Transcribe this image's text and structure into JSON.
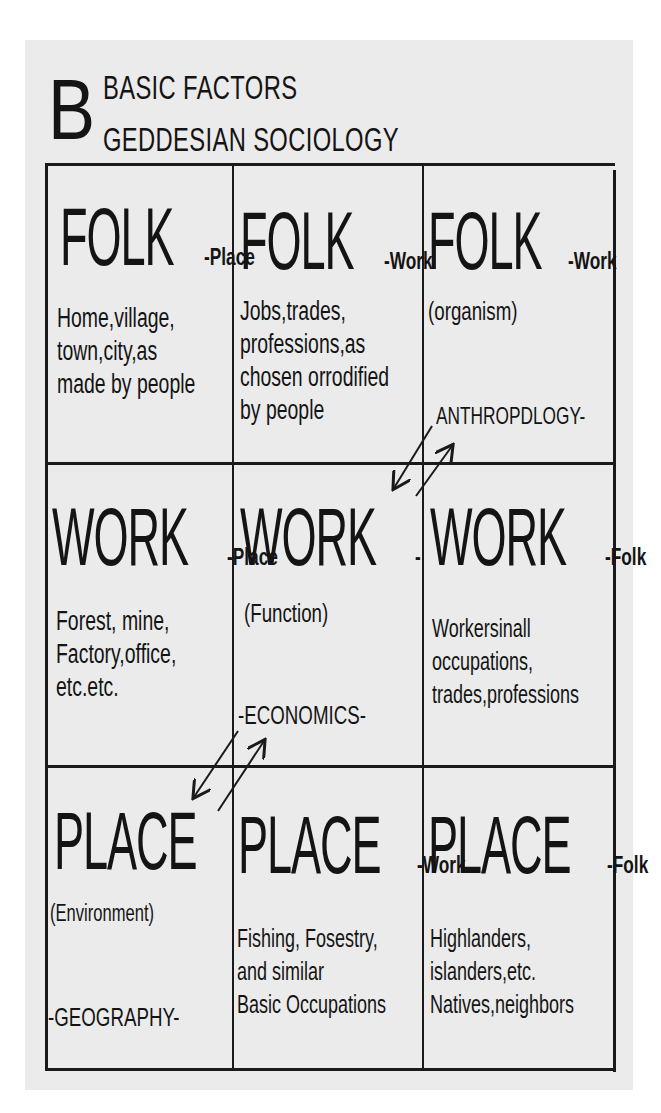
{
  "title": {
    "letter": "B",
    "line1": "BASIC FACTORS",
    "line2": "GEDDESIAN SOCIOLOGY"
  },
  "grid": {
    "rows": [
      {
        "cells": [
          {
            "main": "FOLK",
            "suffix": "-Place",
            "sub": "",
            "lines": [
              "Home,village,",
              "town,city,as",
              "made by people"
            ],
            "discipline": ""
          },
          {
            "main": "FOLK",
            "suffix": "-Work",
            "sub": "",
            "lines": [
              "Jobs,trades,",
              "professions,as",
              "chosen orrodified",
              "by people"
            ],
            "discipline": ""
          },
          {
            "main": "FOLK",
            "suffix": "-Work",
            "sub": "(organism)",
            "lines": [],
            "discipline": "ANTHROPDLOGY-"
          }
        ]
      },
      {
        "cells": [
          {
            "main": "WORK",
            "suffix": "-Place",
            "sub": "",
            "lines": [
              "Forest, mine,",
              "Factory,office,",
              "etc.etc."
            ],
            "discipline": ""
          },
          {
            "main": "WORK",
            "suffix": "-",
            "sub": "(Function)",
            "lines": [],
            "discipline": "-ECONOMICS-"
          },
          {
            "main": "WORK",
            "suffix": "-Folk",
            "sub": "",
            "lines": [
              "Workersinall",
              "occupations,",
              "trades,professions"
            ],
            "discipline": ""
          }
        ]
      },
      {
        "cells": [
          {
            "main": "PLACE",
            "suffix": "",
            "sub": "(Environment)",
            "lines": [],
            "discipline": "-GEOGRAPHY-"
          },
          {
            "main": "PLACE",
            "suffix": "-Work",
            "sub": "",
            "lines": [
              "Fishing, Fosestry,",
              "and similar",
              "Basic Occupations"
            ],
            "discipline": ""
          },
          {
            "main": "PLACE",
            "suffix": "-Folk",
            "sub": "",
            "lines": [
              "Highlanders,",
              "islanders,etc.",
              "Natives,neighbors"
            ],
            "discipline": ""
          }
        ]
      }
    ]
  },
  "arrows": [
    {
      "name": "arrow-folk-to-work-diagonal",
      "between": "FOLK-Work (organism) / WORK (Function)"
    },
    {
      "name": "arrow-work-to-place-diagonal",
      "between": "WORK (Function) / PLACE (Environment)"
    }
  ]
}
